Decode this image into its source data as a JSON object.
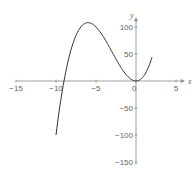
{
  "chart_data": {
    "type": "line",
    "title": "",
    "xlabel": "x",
    "ylabel": "y",
    "xlim": [
      -15,
      6
    ],
    "ylim": [
      -150,
      110
    ],
    "x_ticks": [
      -15,
      -10,
      -5,
      0,
      5
    ],
    "x_tick_labels": [
      "−15",
      "−10",
      "−5",
      "0",
      "5"
    ],
    "y_ticks": [
      100,
      50,
      -50,
      -100,
      -150
    ],
    "y_tick_labels": [
      "100",
      "50",
      "−50",
      "−100",
      "−150"
    ],
    "grid": false,
    "legend": null,
    "series": [
      {
        "name": "y = x³ + 9x²",
        "x": [
          -10,
          -9.5,
          -9,
          -8.5,
          -8,
          -7.5,
          -7,
          -6.5,
          -6,
          -5.5,
          -5,
          -4.5,
          -4,
          -3.5,
          -3,
          -2.5,
          -2,
          -1.5,
          -1,
          -0.5,
          0,
          0.5,
          1,
          1.5,
          2
        ],
        "y": [
          -100,
          -47.5,
          0,
          36.1,
          64,
          84.4,
          98,
          105.6,
          108,
          105.9,
          100,
          91.1,
          80,
          67.4,
          54,
          40.6,
          28,
          16.9,
          8,
          2.1,
          0,
          2.4,
          10,
          23.6,
          44
        ]
      }
    ],
    "colors": {
      "curve": "#333333",
      "axis": "#888888",
      "text": "#666666"
    }
  }
}
